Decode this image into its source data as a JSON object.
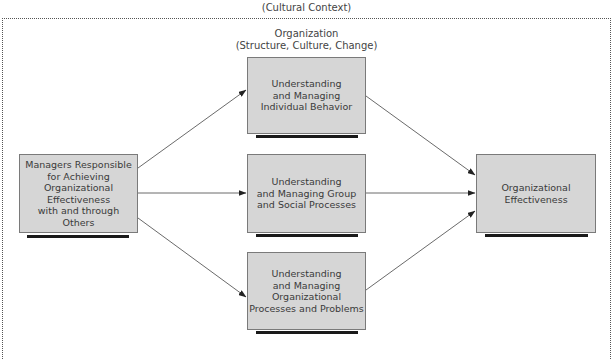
{
  "context": {
    "label": "(Cultural Context)"
  },
  "organization": {
    "line1": "Organization",
    "line2": "(Structure, Culture, Change)"
  },
  "boxes": {
    "managers": {
      "lines": [
        "Managers Responsible",
        "for Achieving",
        "Organizational",
        "Effectiveness",
        "with and through",
        "Others"
      ]
    },
    "individual": {
      "lines": [
        "Understanding",
        "and Managing",
        "Individual Behavior"
      ]
    },
    "group": {
      "lines": [
        "Understanding",
        "and Managing Group",
        "and Social Processes"
      ]
    },
    "processes": {
      "lines": [
        "Understanding",
        "and Managing",
        "Organizational",
        "Processes and Problems"
      ]
    },
    "effectiveness": {
      "lines": [
        "Organizational",
        "Effectiveness"
      ]
    }
  },
  "colors": {
    "box_fill": "#d6d6d6",
    "box_border": "#7a7a7a",
    "shadow": "#1a1a1a",
    "arrow": "#333333"
  }
}
